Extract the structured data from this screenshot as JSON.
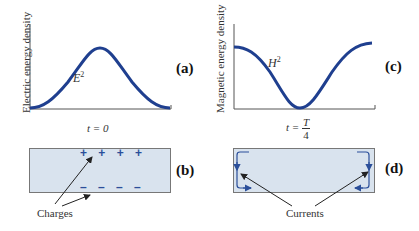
{
  "figure": {
    "panels": {
      "a": {
        "label": "(a)",
        "y_axis_label": "Electric energy density",
        "curve_label_base": "E",
        "curve_label_exp": "2",
        "curve_shape": "single hump (sin^2-like), zero at ends, max at center",
        "time_label": "t = 0"
      },
      "b": {
        "label": "(b)",
        "top_charges": "+ + + +",
        "bottom_charges": "– – – –",
        "annotation": "Charges"
      },
      "c": {
        "label": "(c)",
        "y_axis_label": "Magnetic energy density",
        "curve_label_base": "H",
        "curve_label_exp": "2",
        "curve_shape": "cos^2-like, max at ends, zero at center",
        "time_label_prefix": "t =",
        "time_fraction_num": "T",
        "time_fraction_den": "4"
      },
      "d": {
        "label": "(d)",
        "annotation": "Currents"
      }
    },
    "colors": {
      "curve": "#1f3f8f",
      "box_fill": "#d9e3ee",
      "box_border": "#777777",
      "charge": "#2b4f9a",
      "arrow": "#222222"
    }
  }
}
